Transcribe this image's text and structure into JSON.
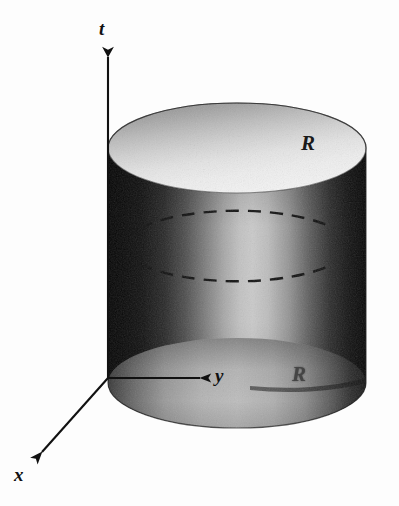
{
  "figure": {
    "kind": "3d-cylinder-spacetime-diagram",
    "background_color": "#fdfdfd",
    "ink_color": "#111111",
    "width": 399,
    "height": 506
  },
  "axes": {
    "t": {
      "label": "t",
      "name": "time-axis",
      "direction": "up",
      "origin": {
        "x": 108,
        "y": 378
      },
      "tip": {
        "x": 108,
        "y": 50
      },
      "label_position": {
        "x": 99,
        "y": 19
      }
    },
    "y": {
      "label": "y",
      "name": "y-axis",
      "direction": "right",
      "origin": {
        "x": 108,
        "y": 378
      },
      "tip": {
        "x": 209,
        "y": 378
      },
      "label_position": {
        "x": 215,
        "y": 366
      }
    },
    "x": {
      "label": "x",
      "name": "x-axis",
      "direction": "down-left",
      "origin": {
        "x": 108,
        "y": 378
      },
      "tip": {
        "x": 33,
        "y": 461
      },
      "label_position": {
        "x": 14,
        "y": 465
      }
    }
  },
  "cylinder": {
    "left_edge_x": 108,
    "right_edge_x": 367,
    "radius_x": 129,
    "radius_y": 45,
    "top_ellipse_center": {
      "x": 237,
      "y": 148
    },
    "bottom_ellipse_center": {
      "x": 237,
      "y": 383
    },
    "top_face_shading": "dark-at-back-rim-bright-toward-front",
    "side_shading": "dark-left-bright-center-dark-right",
    "dashed_cross_section": {
      "upper_arc_y": 222,
      "lower_arc_y": 305,
      "style": "dashed",
      "description": "hidden circular cross-section of the cylinder"
    }
  },
  "labels": {
    "radius_top": {
      "text": "R",
      "name": "radius-label-top",
      "position": {
        "x": 301,
        "y": 133
      }
    },
    "radius_bottom": {
      "text": "R",
      "name": "radius-label-bottom",
      "position": {
        "x": 292,
        "y": 364
      },
      "note": "partially obscured by dark shading"
    }
  },
  "colors": {
    "background": "#fdfdfd",
    "axis_ink": "#111111",
    "body_dark": "#0d0d0d",
    "body_mid": "#7a7a7a",
    "body_bright": "#d8d8d8",
    "top_face_dark": "#9a9a9a",
    "top_face_bright": "#f2f2f2",
    "bottom_face_mid": "#9d9d9d",
    "dash_ink": "#141414"
  }
}
